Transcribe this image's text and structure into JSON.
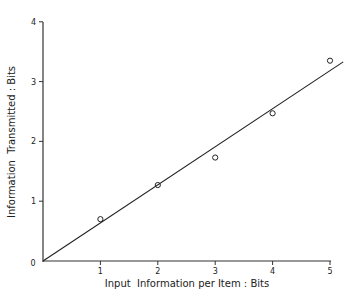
{
  "chart_data": {
    "type": "scatter",
    "title": "",
    "xlabel": "Input  Information per Item : Bits",
    "ylabel": "Information  Transmitted : Bits",
    "xlim": [
      0,
      5.4
    ],
    "ylim": [
      0,
      4
    ],
    "x_ticks": [
      1,
      2,
      3,
      4,
      5
    ],
    "y_ticks": [
      0,
      1,
      2,
      3,
      4
    ],
    "origin_label": "0",
    "grid": false,
    "legend": null,
    "series": [
      {
        "name": "observed",
        "marker": "open-circle",
        "x": [
          1,
          2,
          3,
          4,
          5
        ],
        "y": [
          0.7,
          1.27,
          1.73,
          2.47,
          3.35
        ]
      },
      {
        "name": "fitted line",
        "style": "line",
        "x": [
          0,
          5.23
        ],
        "y": [
          0,
          3.33
        ]
      }
    ]
  }
}
